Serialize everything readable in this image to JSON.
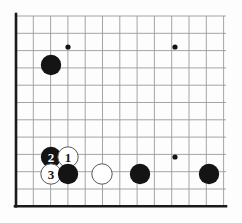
{
  "diagram": {
    "kind": "go-board-diagram",
    "colors": {
      "background": "#fdfdfd",
      "grid_line": "#9a9a9a",
      "border_line": "#1a1a1a",
      "black_stone": "#141414",
      "white_stone": "#ffffff",
      "white_stone_outline": "#5a5a5a",
      "black_label_text": "#ffffff",
      "white_label_text": "#141414",
      "star_point": "#141414"
    },
    "geometry": {
      "origin_x": 16,
      "origin_y": 16,
      "spacing": 17.3,
      "cols": 13,
      "rows": 12,
      "stone_radius": 10.2,
      "star_radius": 2.6,
      "grid_line_width": 0.9,
      "border_line_width": 2.6
    }
  },
  "grid": {
    "vertical_lines": [
      16,
      33.3,
      50.6,
      67.9,
      85.2,
      102.5,
      119.8,
      137.1,
      154.4,
      171.7,
      189,
      206.3,
      223.6
    ],
    "horizontal_lines": [
      16,
      33.3,
      50.6,
      67.9,
      85.2,
      102.5,
      119.8,
      137.1,
      154.4,
      171.7,
      189,
      206.3
    ],
    "left_border_x": 16,
    "bottom_border_y": 206.3,
    "grid_top_y": 16,
    "grid_right_x": 226,
    "grid_bottom_y": 206.3
  },
  "star_points": [
    {
      "name": "star-point-upper-left",
      "x": 68,
      "y": 47
    },
    {
      "name": "star-point-upper-right",
      "x": 175,
      "y": 47
    },
    {
      "name": "star-point-lower-right",
      "x": 175,
      "y": 157
    }
  ],
  "stones": [
    {
      "id": "black-corner-upper-left",
      "color": "black",
      "x": 51,
      "y": 65,
      "label": ""
    },
    {
      "id": "black-move-2",
      "color": "black",
      "x": 51,
      "y": 157,
      "label": "2"
    },
    {
      "id": "white-move-1",
      "color": "white",
      "x": 68,
      "y": 157,
      "label": "1"
    },
    {
      "id": "white-move-3",
      "color": "white",
      "x": 51,
      "y": 174,
      "label": "3"
    },
    {
      "id": "black-bottom-b",
      "color": "black",
      "x": 68,
      "y": 174,
      "label": ""
    },
    {
      "id": "white-bottom-c",
      "color": "white",
      "x": 102,
      "y": 174,
      "label": ""
    },
    {
      "id": "black-bottom-d",
      "color": "black",
      "x": 140,
      "y": 174,
      "label": ""
    },
    {
      "id": "black-bottom-e",
      "color": "black",
      "x": 209,
      "y": 174,
      "label": ""
    }
  ],
  "move_sequence": [
    {
      "number": "1",
      "color": "white"
    },
    {
      "number": "2",
      "color": "black"
    },
    {
      "number": "3",
      "color": "white"
    }
  ]
}
